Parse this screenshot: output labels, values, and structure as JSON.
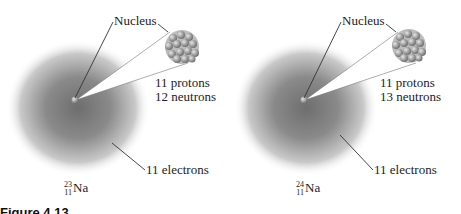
{
  "panels": [
    {
      "nucleus_label": "Nucleus",
      "protons": "11 protons",
      "neutrons": "12 neutrons",
      "electrons": "11 electrons",
      "isotope": {
        "mass_number": "23",
        "atomic_number": "11",
        "symbol": "Na"
      }
    },
    {
      "nucleus_label": "Nucleus",
      "protons": "11 protons",
      "neutrons": "13 neutrons",
      "electrons": "11 electrons",
      "isotope": {
        "mass_number": "24",
        "atomic_number": "11",
        "symbol": "Na"
      }
    }
  ],
  "caption": "Figure 4.13"
}
